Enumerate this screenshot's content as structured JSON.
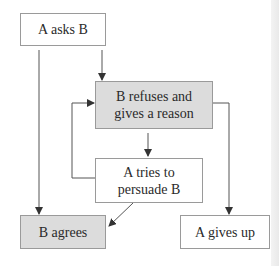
{
  "diagram": {
    "type": "flowchart",
    "nodes": [
      {
        "id": "ask",
        "label": "A asks B",
        "shaded": false
      },
      {
        "id": "refuse",
        "label_line1": "B refuses and",
        "label_line2": "gives a reason",
        "shaded": true
      },
      {
        "id": "persuade",
        "label_line1": "A tries to",
        "label_line2": "persuade B",
        "shaded": false
      },
      {
        "id": "agree",
        "label": "B agrees",
        "shaded": true
      },
      {
        "id": "giveup",
        "label": "A gives up",
        "shaded": false
      }
    ],
    "edges": [
      {
        "from": "ask",
        "to": "refuse"
      },
      {
        "from": "ask",
        "to": "agree"
      },
      {
        "from": "refuse",
        "to": "persuade"
      },
      {
        "from": "refuse",
        "to": "giveup"
      },
      {
        "from": "persuade",
        "to": "refuse"
      },
      {
        "from": "persuade",
        "to": "agree"
      }
    ],
    "colors": {
      "shaded_fill": "#dcdcdc",
      "border": "#9a9a9a",
      "line": "#555555"
    }
  }
}
